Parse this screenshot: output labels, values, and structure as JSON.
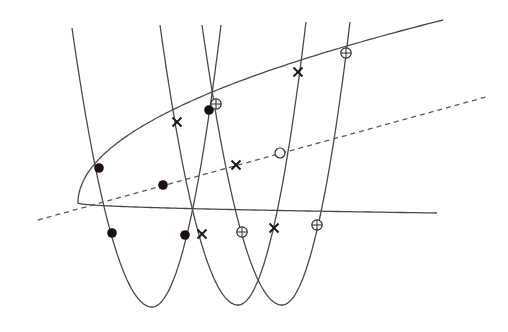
{
  "diagram": {
    "type": "geometric-construction",
    "colors": {
      "curve": "#4a4a4a",
      "dashed": "#5a5a5a",
      "marker": "#1a1010",
      "background": "#ffffff"
    },
    "curves": {
      "sideways_parabola": {
        "orientation": "opens-right",
        "vertex": [
          78,
          203
        ],
        "upper_branch_end": [
          443,
          20
        ],
        "lower_branch_end": [
          437,
          213
        ]
      },
      "vertical_parabolas": [
        {
          "id": "p1",
          "left_top": [
            72,
            28
          ],
          "vertex": [
            152,
            307
          ],
          "right_top": [
            221,
            25
          ]
        },
        {
          "id": "p2",
          "left_top": [
            160,
            25
          ],
          "vertex": [
            238,
            305
          ],
          "right_top": [
            306,
            22
          ]
        },
        {
          "id": "p3",
          "left_top": [
            202,
            25
          ],
          "vertex": [
            282,
            305
          ],
          "right_top": [
            350,
            22
          ]
        }
      ],
      "dashed_line": {
        "start": [
          38,
          220
        ],
        "end": [
          486,
          97
        ]
      }
    },
    "markers": {
      "filled_dots": [
        [
          99,
          168
        ],
        [
          112,
          233
        ],
        [
          185,
          235
        ],
        [
          209,
          110
        ],
        [
          163,
          185
        ]
      ],
      "crosses": [
        [
          177,
          122
        ],
        [
          202,
          234
        ],
        [
          236,
          165
        ],
        [
          274,
          228
        ],
        [
          298,
          72
        ]
      ],
      "circled_plus": [
        [
          216,
          104
        ],
        [
          242,
          232
        ],
        [
          317,
          225
        ],
        [
          346,
          53
        ]
      ],
      "open_circles": [
        [
          280,
          153
        ]
      ]
    }
  }
}
